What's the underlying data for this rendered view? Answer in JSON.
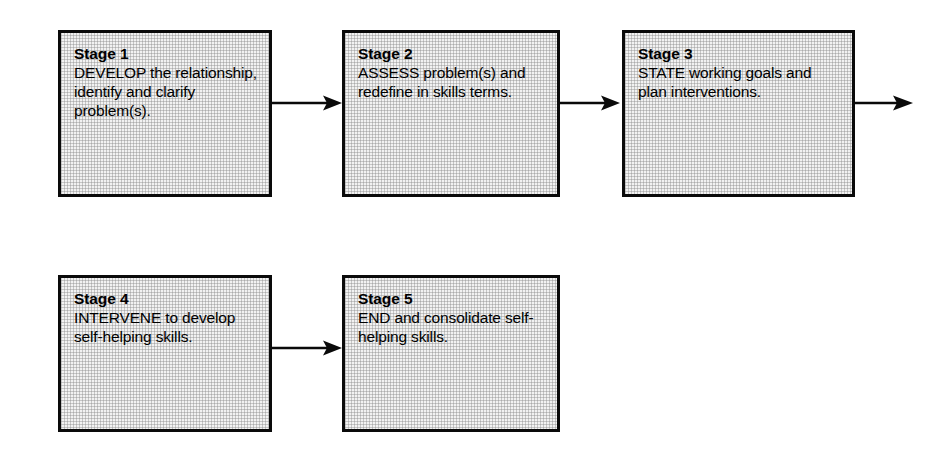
{
  "diagram": {
    "type": "flowchart",
    "orientation": "horizontal-wrapped",
    "background_color": "#ffffff",
    "box_border_color": "#0a0a0a",
    "box_fill_color": "#f2f2f2",
    "arrow_color": "#0a0a0a",
    "nodes": [
      {
        "id": "stage-1",
        "title": "Stage 1",
        "body": "DEVELOP the relationship, identify and clarify problem(s)."
      },
      {
        "id": "stage-2",
        "title": "Stage 2",
        "body": "ASSESS problem(s) and redefine in skills terms."
      },
      {
        "id": "stage-3",
        "title": "Stage 3",
        "body": "STATE working goals and plan interventions."
      },
      {
        "id": "stage-4",
        "title": "Stage 4",
        "body": "INTERVENE to develop self-helping skills."
      },
      {
        "id": "stage-5",
        "title": "Stage 5",
        "body": "END and consolidate self-helping skills."
      }
    ],
    "connectors": [
      {
        "id": "arrow-1-to-2",
        "from": "stage-1",
        "to": "stage-2"
      },
      {
        "id": "arrow-2-to-3",
        "from": "stage-2",
        "to": "stage-3"
      },
      {
        "id": "arrow-3-to-4",
        "from": "stage-3",
        "to": "stage-4"
      },
      {
        "id": "arrow-4-to-5",
        "from": "stage-4",
        "to": "stage-5"
      }
    ]
  }
}
